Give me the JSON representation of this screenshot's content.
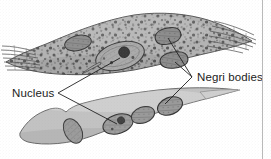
{
  "figure": {
    "kind": "biology-diagram",
    "background_color": "#ffffff",
    "ink_color": "#1c1c1c",
    "labels": [
      {
        "id": "nucleus",
        "text": "Nucleus",
        "x": 12,
        "y": 88,
        "leader_vertex": {
          "x": 58,
          "y": 93
        },
        "leader_targets": [
          {
            "x": 120,
            "y": 57,
            "points_to": "upper-cell-nucleus"
          },
          {
            "x": 119,
            "y": 124,
            "points_to": "lower-cell-nucleus"
          }
        ]
      },
      {
        "id": "negri-bodies",
        "text": "Negri bodies",
        "x": 197,
        "y": 72,
        "leader_vertex": {
          "x": 192,
          "y": 77
        },
        "leader_targets": [
          {
            "x": 168,
            "y": 37,
            "points_to": "upper-negri-body-1"
          },
          {
            "x": 174,
            "y": 60,
            "points_to": "upper-negri-body-2"
          },
          {
            "x": 164,
            "y": 105,
            "points_to": "lower-negri-body"
          }
        ]
      }
    ],
    "upper_cell": {
      "name": "upper-neuron",
      "shape": "spindle / fusiform",
      "fill_color": "#b3b3b3",
      "outline_color": "#5b5b5b",
      "cytoplasm": "dense dark granular speckles",
      "striations": [
        "left-tip",
        "right-tip"
      ],
      "nucleus": {
        "cx": 120,
        "cy": 56,
        "rx": 24,
        "ry": 13,
        "rotation": -16,
        "fill_color": "#a8a8a8",
        "nucleolus": {
          "cx": 124,
          "cy": 53,
          "r": 5,
          "fill_color": "#3b3b3b"
        }
      },
      "negri_bodies": [
        {
          "cx": 168,
          "cy": 36,
          "rx": 13,
          "ry": 8,
          "rotation": -14,
          "fill_color": "#8d8d8d"
        },
        {
          "cx": 174,
          "cy": 60,
          "rx": 14,
          "ry": 8,
          "rotation": -8,
          "fill_color": "#8d8d8d"
        },
        {
          "cx": 78,
          "cy": 43,
          "rx": 13,
          "ry": 7,
          "rotation": -12,
          "fill_color": "#8d8d8d"
        }
      ]
    },
    "lower_cell": {
      "name": "lower-neuron",
      "shape": "curved crescent tapering right",
      "fill_color": "#c2c2c2",
      "outline_color": "#6d6d6d",
      "cytoplasm": "smooth, untextured",
      "notch": "upper-left margin",
      "nucleus": {
        "cx": 118,
        "cy": 124,
        "rx": 15,
        "ry": 9,
        "rotation": -18,
        "fill_color": "#9d9d9d",
        "nucleolus": {
          "cx": 122,
          "cy": 121,
          "r": 3.4,
          "fill_color": "#454545"
        }
      },
      "inclusion_bodies": [
        {
          "cx": 73,
          "cy": 131,
          "rx": 9,
          "ry": 13,
          "rotation": -28,
          "fill_color": "#9a9a9a"
        },
        {
          "cx": 143,
          "cy": 115,
          "rx": 12,
          "ry": 8,
          "rotation": -20,
          "fill_color": "#9a9a9a"
        },
        {
          "cx": 170,
          "cy": 106,
          "rx": 13,
          "ry": 8,
          "rotation": -22,
          "fill_color": "#9a9a9a"
        }
      ]
    },
    "right_rule": {
      "x": 262,
      "color": "#b9b9b9"
    }
  }
}
